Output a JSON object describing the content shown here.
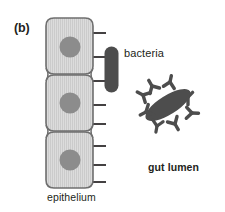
{
  "figure": {
    "panel_label": "(b)",
    "background_color": "#ffffff"
  },
  "labels": {
    "bacteria": "bacteria",
    "gut_lumen": "gut lumen",
    "epithelium": "epithelium"
  },
  "colors": {
    "outline": "#231f20",
    "cell_fill": "#d9d9d9",
    "cell_stripe": "#cfcfcf",
    "cell_border": "#6f6f6f",
    "nucleus": "#8c8c8c",
    "bacterium": "#4d4d4d",
    "antibody": "#4d4d4d",
    "text": "#231f20"
  },
  "diagram": {
    "epithelium": {
      "cell_count": 3,
      "cells": [
        {
          "x": 46,
          "y": 18,
          "width": 47,
          "height": 56,
          "nucleus_cx": 70,
          "nucleus_cy": 47,
          "nucleus_r": 10.5
        },
        {
          "x": 46,
          "y": 75,
          "width": 47,
          "height": 56,
          "nucleus_cx": 70,
          "nucleus_cy": 103,
          "nucleus_r": 10.5
        },
        {
          "x": 46,
          "y": 132,
          "width": 47,
          "height": 56,
          "nucleus_cx": 70,
          "nucleus_cy": 160,
          "nucleus_r": 10.5
        }
      ],
      "microvilli_count": 8,
      "microvilli_y": [
        33,
        57,
        81,
        105,
        124,
        146,
        165,
        182
      ],
      "microvilli_x_start": 93,
      "microvilli_x_end": 106
    },
    "adherent_bacterium": {
      "cx": 111.5,
      "cy": 69.5,
      "rx": 7,
      "ry": 23,
      "rotation": 0
    },
    "opsonized_bacterium": {
      "cx": 168,
      "cy": 105,
      "rx": 26,
      "ry": 9.5,
      "rotation": -32,
      "antibody_count": 8,
      "antibodies": [
        {
          "cx": 143,
          "cy": 95,
          "rot": 118
        },
        {
          "cx": 152,
          "cy": 86,
          "rot": 150
        },
        {
          "cx": 170,
          "cy": 82,
          "rot": 192
        },
        {
          "cx": 188,
          "cy": 97,
          "rot": 225
        },
        {
          "cx": 192,
          "cy": 113,
          "rot": 272
        },
        {
          "cx": 175,
          "cy": 124,
          "rot": 330
        },
        {
          "cx": 157,
          "cy": 126,
          "rot": 10,
          "scale": 0.95
        },
        {
          "cx": 146,
          "cy": 112,
          "rot": 62
        }
      ]
    }
  }
}
